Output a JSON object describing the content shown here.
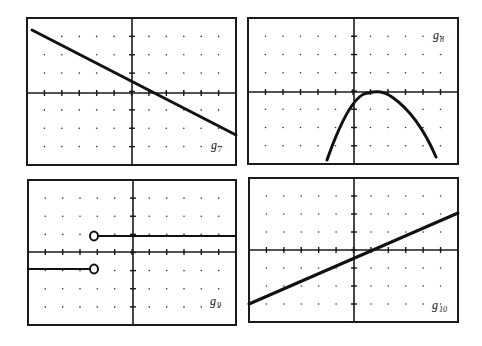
{
  "chart_data": [
    {
      "type": "line",
      "label": "g",
      "label_sub": "7",
      "title": "g7",
      "description": "Decreasing straight line",
      "grid": true,
      "x_range": [
        -6,
        6
      ],
      "y_range": [
        -4,
        4
      ],
      "points": [
        [
          -5.8,
          3.5
        ],
        [
          6,
          -2.3
        ]
      ],
      "y_intercept": 1.0,
      "x_intercept": 1.5
    },
    {
      "type": "line",
      "label": "g",
      "label_sub": "8",
      "title": "g8",
      "description": "Downward-opening parabola with vertex on x-axis",
      "grid": true,
      "x_range": [
        -6,
        6
      ],
      "y_range": [
        -4,
        4
      ],
      "vertex": [
        1.5,
        0
      ],
      "y_intercept": -0.8,
      "endpoints": [
        [
          -1.6,
          -3.8
        ],
        [
          4.6,
          -3.6
        ]
      ]
    },
    {
      "type": "line",
      "label": "g",
      "label_sub": "9",
      "title": "g9",
      "description": "Step function with open circles at x = -2",
      "grid": true,
      "x_range": [
        -6,
        6
      ],
      "y_range": [
        -4,
        4
      ],
      "segments": [
        {
          "from": [
            -2,
            1
          ],
          "to": [
            6,
            1
          ],
          "open_left": true
        },
        {
          "from": [
            -6,
            -1
          ],
          "to": [
            -2,
            -1
          ],
          "open_right": true
        }
      ]
    },
    {
      "type": "line",
      "label": "g",
      "label_sub": "10",
      "title": "g10",
      "description": "Increasing straight line",
      "grid": true,
      "x_range": [
        -6,
        6
      ],
      "y_range": [
        -4,
        4
      ],
      "points": [
        [
          -6,
          -3
        ],
        [
          6,
          2
        ]
      ],
      "y_intercept": -0.5,
      "x_intercept": 1.2
    }
  ],
  "labels": {
    "p1": {
      "main": "g",
      "sub": "7"
    },
    "p2": {
      "main": "g",
      "sub": "8"
    },
    "p3": {
      "main": "g",
      "sub": "9"
    },
    "p4": {
      "main": "g",
      "sub": "10"
    }
  }
}
